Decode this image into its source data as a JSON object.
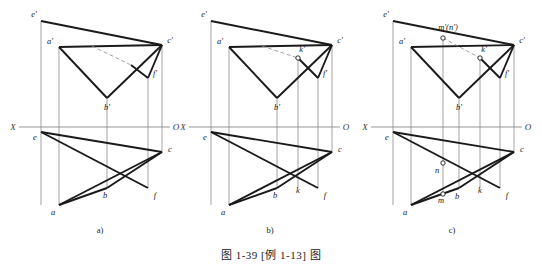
{
  "figure": {
    "caption": "图 1-39   [例 1-13] 图",
    "background_color": "#ffffff",
    "line_color_heavy": "#1a1a1a",
    "line_color_thin": "#8a8a8a",
    "label_color": "#1a1a1a"
  },
  "panels": [
    {
      "id": "a",
      "sub_label": "a)",
      "axis": {
        "left_label": "X",
        "right_label": "O"
      },
      "labels": [
        {
          "key": "e_prime",
          "text": "e'"
        },
        {
          "key": "a_prime",
          "text": "a'"
        },
        {
          "key": "c_prime",
          "text": "c'"
        },
        {
          "key": "f_prime",
          "text": "f'"
        },
        {
          "key": "b_prime",
          "text": "b'"
        },
        {
          "key": "e",
          "text": "e"
        },
        {
          "key": "c",
          "text": "c"
        },
        {
          "key": "b",
          "text": "b"
        },
        {
          "key": "f",
          "text": "f"
        },
        {
          "key": "a",
          "text": "a"
        }
      ]
    },
    {
      "id": "b",
      "sub_label": "b)",
      "axis": {
        "left_label": "X",
        "right_label": "O"
      },
      "labels": [
        {
          "key": "e_prime",
          "text": "e'"
        },
        {
          "key": "a_prime",
          "text": "a'"
        },
        {
          "key": "c_prime",
          "text": "c'"
        },
        {
          "key": "k_prime",
          "text": "k'"
        },
        {
          "key": "f_prime",
          "text": "f'"
        },
        {
          "key": "b_prime",
          "text": "b'"
        },
        {
          "key": "e",
          "text": "e"
        },
        {
          "key": "c",
          "text": "c"
        },
        {
          "key": "b",
          "text": "b"
        },
        {
          "key": "k",
          "text": "k"
        },
        {
          "key": "f",
          "text": "f"
        },
        {
          "key": "a",
          "text": "a"
        }
      ]
    },
    {
      "id": "c",
      "sub_label": "c)",
      "axis": {
        "left_label": "X",
        "right_label": "O"
      },
      "labels": [
        {
          "key": "e_prime",
          "text": "e'"
        },
        {
          "key": "mn_prime",
          "text": "m'(n')"
        },
        {
          "key": "a_prime",
          "text": "a'"
        },
        {
          "key": "c_prime",
          "text": "c'"
        },
        {
          "key": "k_prime",
          "text": "k'"
        },
        {
          "key": "f_prime",
          "text": "f'"
        },
        {
          "key": "b_prime",
          "text": "b'"
        },
        {
          "key": "e",
          "text": "e"
        },
        {
          "key": "c",
          "text": "c"
        },
        {
          "key": "n",
          "text": "n"
        },
        {
          "key": "m",
          "text": "m"
        },
        {
          "key": "b",
          "text": "b"
        },
        {
          "key": "k",
          "text": "k"
        },
        {
          "key": "f",
          "text": "f"
        },
        {
          "key": "a",
          "text": "a"
        }
      ]
    }
  ],
  "geometry": {
    "note": "Projection drawing: frontal (above X-O axis) and horizontal (below) views of two intersecting triangles ABC and EFC.",
    "panel_a_origin_x": 0,
    "panel_b_origin_x": 190,
    "panel_c_origin_x": 372,
    "axis_y": 127
  }
}
